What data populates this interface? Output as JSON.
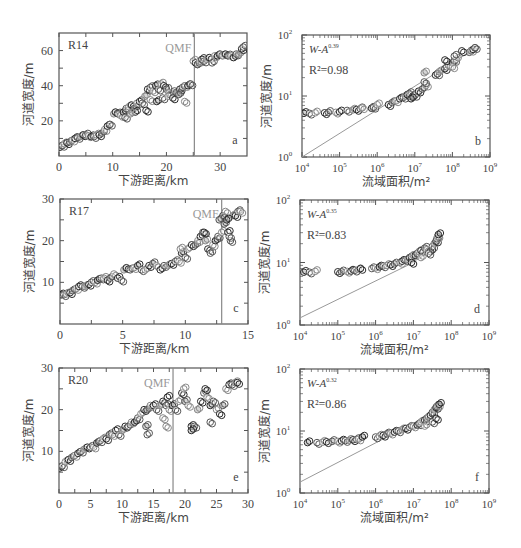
{
  "header_fragment": "",
  "chart_data": [
    {
      "id": "a",
      "type": "scatter",
      "panel_label": "a",
      "site": "R14",
      "xscale": "linear",
      "yscale": "linear",
      "xlabel": "下游距离/km",
      "ylabel": "河道宽度/m",
      "xlim": [
        0,
        35
      ],
      "ylim": [
        0,
        70
      ],
      "xticks": [
        0,
        10,
        20,
        30
      ],
      "yticks": [
        20,
        40,
        60
      ],
      "minor_x": [
        5,
        15,
        25
      ],
      "minor_y": [
        10,
        30,
        50
      ],
      "qmf": {
        "label": "QMF",
        "x": 25.2
      },
      "box": {
        "x": 59,
        "y": 33,
        "w": 188,
        "h": 123
      },
      "series": [
        {
          "name": "width",
          "x": [
            0.2,
            0.6,
            1,
            1.5,
            2,
            2.5,
            3,
            3.5,
            4,
            4.5,
            5,
            5.5,
            6,
            6.5,
            7,
            7.5,
            8,
            8.5,
            9,
            9.5,
            10.2,
            10.5,
            11,
            11.5,
            12,
            12.5,
            13,
            13.5,
            14,
            14.5,
            15,
            15.5,
            16,
            16.5,
            17,
            17.5,
            18,
            18.5,
            19,
            19.5,
            20,
            20.5,
            21,
            21.5,
            22,
            22.5,
            23,
            23.5,
            24,
            24.5,
            25,
            25.4,
            25.8,
            26.2,
            26.6,
            27,
            27.5,
            28,
            28.5,
            29,
            29.5,
            30,
            30.5,
            31,
            31.5,
            32,
            32.5,
            33,
            33.5,
            34,
            34.3,
            17,
            18.2,
            19.3,
            20.3,
            21.2,
            22.3,
            23.4,
            14.2,
            12.3,
            13.3,
            16.2
          ],
          "y": [
            5,
            6,
            7,
            7.5,
            8,
            9,
            10,
            10.5,
            11,
            12,
            12,
            11.5,
            11,
            11,
            12,
            12,
            13,
            15,
            17,
            18,
            24,
            25,
            24,
            23,
            25,
            27,
            28,
            29,
            27,
            30,
            31,
            30,
            34,
            38,
            39,
            37,
            40,
            38,
            41,
            40,
            38,
            36,
            35,
            37,
            36,
            38,
            39,
            40,
            40,
            41,
            54,
            53,
            52,
            54,
            55,
            54,
            55,
            56,
            53,
            57,
            57,
            58,
            57,
            58,
            57,
            57,
            56,
            58,
            58,
            61,
            62,
            32,
            31,
            33,
            34,
            33,
            35,
            31,
            25,
            22,
            24,
            26
          ]
        }
      ]
    },
    {
      "id": "b",
      "type": "scatter",
      "panel_label": "b",
      "xscale": "log",
      "yscale": "log",
      "xlabel": "流域面积/m²",
      "ylabel": "河道宽度/m",
      "xlim_exp": [
        4,
        9
      ],
      "ylim_exp": [
        0,
        2
      ],
      "xtick_exps": [
        4,
        5,
        6,
        7,
        8,
        9
      ],
      "ytick_exps": [
        0,
        1,
        2
      ],
      "equation": {
        "base": "W-A",
        "exponent": "0.39"
      },
      "r2": {
        "label": "R²=0.98",
        "value": 0.98
      },
      "fit_line": {
        "x_exp": [
          4,
          8.6
        ],
        "y": [
          1.0,
          60
        ]
      },
      "box": {
        "x": 302,
        "y": 35,
        "w": 188,
        "h": 122
      },
      "series": [
        {
          "name": "width",
          "logx": [
            4.05,
            4.2,
            4.35,
            4.6,
            4.7,
            4.9,
            5.0,
            5.2,
            5.35,
            5.45,
            5.55,
            5.6,
            5.85,
            5.9,
            6.0,
            6.3,
            6.4,
            6.5,
            6.6,
            6.7,
            6.75,
            6.8,
            6.85,
            6.9,
            6.95,
            7.0,
            7.05,
            7.1,
            7.2,
            7.3,
            7.55,
            7.6,
            7.65,
            7.8,
            7.85,
            7.9,
            8.0,
            8.05,
            8.1,
            8.25,
            8.45,
            8.5,
            8.55,
            8.6,
            7.25,
            7.8,
            8.05,
            8.0,
            6.9,
            7.25
          ],
          "y": [
            5.2,
            5.2,
            5.3,
            5.3,
            5.4,
            5.4,
            5.5,
            5.8,
            5.9,
            6.0,
            6.2,
            6.4,
            6.3,
            6.5,
            7.2,
            7.2,
            7.8,
            8.3,
            9.0,
            9.5,
            10,
            10.5,
            11,
            10.5,
            10,
            10.2,
            11,
            12,
            13,
            15,
            22,
            23,
            25,
            28,
            30,
            32,
            35,
            38,
            40,
            55,
            52,
            56,
            58,
            62,
            24,
            39,
            45,
            30,
            9,
            17
          ]
        }
      ]
    },
    {
      "id": "c",
      "type": "scatter",
      "panel_label": "c",
      "site": "R17",
      "xscale": "linear",
      "yscale": "linear",
      "xlabel": "下游距离/km",
      "ylabel": "河道宽度/m",
      "xlim": [
        0,
        15
      ],
      "ylim": [
        0,
        30
      ],
      "xticks": [
        0,
        5,
        10,
        15
      ],
      "yticks": [
        10,
        20,
        30
      ],
      "minor_x": [
        2.5,
        7.5,
        12.5
      ],
      "minor_y": [
        5,
        15,
        25
      ],
      "qmf": {
        "label": "QMF",
        "x": 12.9
      },
      "box": {
        "x": 60,
        "y": 199,
        "w": 188,
        "h": 125
      },
      "series": [
        {
          "name": "width",
          "x": [
            0.1,
            0.3,
            0.5,
            0.8,
            1,
            1.3,
            1.5,
            1.8,
            2,
            2.3,
            2.5,
            2.8,
            3,
            3.3,
            3.5,
            3.8,
            4,
            4.3,
            4.6,
            4.9,
            5.1,
            5.3,
            5.6,
            5.9,
            6.2,
            6.5,
            6.8,
            7.1,
            7.4,
            7.7,
            8,
            8.3,
            8.6,
            8.9,
            9.2,
            9.5,
            9.7,
            10,
            10.2,
            10.5,
            10.8,
            11,
            11.2,
            11.4,
            11.6,
            11.8,
            12,
            12.2,
            12.4,
            12.6,
            12.9,
            13,
            13.1,
            13.2,
            13.4,
            13.6,
            13.8,
            14,
            14.2,
            14.4,
            13.3,
            13.5,
            9.6,
            11.5,
            12.7
          ],
          "y": [
            7,
            7,
            7.2,
            7.5,
            8,
            8.5,
            9,
            9,
            9,
            9.5,
            10,
            10,
            10.5,
            11,
            11,
            10.5,
            11,
            12,
            11,
            10.5,
            13,
            13.5,
            13,
            13.5,
            14,
            13,
            13,
            14,
            14.5,
            14,
            13,
            14,
            14,
            14.5,
            15,
            15,
            17,
            16,
            18,
            19,
            19,
            20,
            21,
            22,
            20,
            18,
            17,
            19,
            20,
            21,
            22,
            26,
            24,
            27,
            22,
            20,
            26,
            26,
            27,
            27,
            25,
            21,
            18,
            22,
            25
          ]
        }
      ]
    },
    {
      "id": "d",
      "type": "scatter",
      "panel_label": "d",
      "xscale": "log",
      "yscale": "log",
      "xlabel": "流域面积/m²",
      "ylabel": "河道宽度/m",
      "xlim_exp": [
        4,
        9
      ],
      "ylim_exp": [
        0,
        2
      ],
      "xtick_exps": [
        4,
        5,
        6,
        7,
        8,
        9
      ],
      "ytick_exps": [
        0,
        1,
        2
      ],
      "equation": {
        "base": "W-A",
        "exponent": "0.35"
      },
      "r2": {
        "label": "R²=0.83",
        "value": 0.83
      },
      "fit_line": {
        "x_exp": [
          4,
          7.0
        ],
        "y": [
          1.3,
          10
        ]
      },
      "box": {
        "x": 300,
        "y": 200,
        "w": 189,
        "h": 125
      },
      "series": [
        {
          "name": "width",
          "logx": [
            4.1,
            4.25,
            4.4,
            5.0,
            5.1,
            5.25,
            5.35,
            5.45,
            5.55,
            5.6,
            5.9,
            6.0,
            6.1,
            6.2,
            6.3,
            6.4,
            6.5,
            6.65,
            6.7,
            6.8,
            6.85,
            6.9,
            6.95,
            7.0,
            7.05,
            7.1,
            7.15,
            7.2,
            7.3,
            7.35,
            7.45,
            7.5,
            7.55,
            7.6,
            7.62,
            7.64,
            7.66,
            7.4,
            7.2,
            6.95
          ],
          "y": [
            7,
            7,
            7.2,
            7.1,
            7.1,
            7.2,
            7.3,
            7.5,
            7.7,
            8,
            8,
            8.2,
            8.5,
            8.8,
            9,
            9.2,
            9.5,
            10,
            10.5,
            11,
            11,
            12,
            12.5,
            13,
            13,
            14,
            15,
            15.5,
            17,
            16,
            15,
            18,
            20,
            22,
            24,
            26,
            28,
            14,
            12,
            10
          ]
        }
      ]
    },
    {
      "id": "e",
      "type": "scatter",
      "panel_label": "e",
      "site": "R20",
      "xscale": "linear",
      "yscale": "linear",
      "xlabel": "下游距离/km",
      "ylabel": "河道宽度/m",
      "xlim": [
        0,
        30
      ],
      "ylim": [
        0,
        30
      ],
      "xticks": [
        0,
        5,
        10,
        15,
        20,
        25,
        30
      ],
      "yticks": [
        10,
        20,
        30
      ],
      "minor_x": [
        2.5,
        7.5,
        12.5,
        17.5,
        22.5,
        27.5
      ],
      "minor_y": [
        5,
        15,
        25
      ],
      "qmf": {
        "label": "QMF",
        "x": 18.1
      },
      "box": {
        "x": 59,
        "y": 368,
        "w": 189,
        "h": 125
      },
      "series": [
        {
          "name": "width",
          "x": [
            0.1,
            0.5,
            1,
            1.5,
            2,
            2.5,
            3,
            3.5,
            4,
            4.5,
            5,
            5.5,
            6,
            6.5,
            7,
            7.5,
            8,
            8.5,
            9,
            9.5,
            10,
            10.5,
            11,
            11.5,
            12,
            12.5,
            13,
            13.5,
            14,
            14.5,
            15,
            15.5,
            16,
            16.5,
            17,
            17.5,
            18,
            18.5,
            19,
            19.5,
            20,
            20.5,
            21,
            21.5,
            22,
            22.5,
            23,
            23.5,
            24,
            24.5,
            25,
            25.5,
            26,
            26.5,
            27,
            27.5,
            28,
            28.3,
            14,
            17,
            21,
            24,
            19.8,
            23.2,
            13.8,
            16.5,
            17.2
          ],
          "y": [
            6,
            6.5,
            7.5,
            8,
            8.5,
            9,
            9.5,
            10,
            10.5,
            11,
            11,
            11,
            12,
            12.5,
            13,
            13,
            14,
            14,
            15,
            14,
            15,
            16,
            16,
            17,
            17,
            18,
            19,
            20,
            20,
            21,
            21,
            20,
            21,
            22,
            21,
            20,
            21,
            20,
            22,
            24,
            22,
            21,
            16,
            16,
            20,
            22,
            24,
            23,
            21,
            22,
            20,
            19,
            21,
            25,
            26,
            26,
            26.5,
            26.5,
            14,
            16,
            15,
            17,
            25,
            25,
            16,
            18,
            23
          ]
        }
      ]
    },
    {
      "id": "f",
      "type": "scatter",
      "panel_label": "f",
      "xscale": "log",
      "yscale": "log",
      "xlabel": "流域面积/m²",
      "ylabel": "河道宽度/m",
      "xlim_exp": [
        4,
        9
      ],
      "ylim_exp": [
        0,
        2
      ],
      "xtick_exps": [
        4,
        5,
        6,
        7,
        8,
        9
      ],
      "ytick_exps": [
        0,
        1,
        2
      ],
      "equation": {
        "base": "W-A",
        "exponent": "0.32"
      },
      "r2": {
        "label": "R²=0.86",
        "value": 0.86
      },
      "fit_line": {
        "x_exp": [
          4,
          6.3
        ],
        "y": [
          1.5,
          8
        ]
      },
      "box": {
        "x": 300,
        "y": 369,
        "w": 189,
        "h": 124
      },
      "series": [
        {
          "name": "width",
          "logx": [
            4.2,
            4.45,
            4.6,
            4.7,
            4.85,
            5.0,
            5.1,
            5.2,
            5.3,
            5.4,
            5.5,
            5.55,
            5.65,
            6.0,
            6.1,
            6.2,
            6.3,
            6.4,
            6.5,
            6.6,
            6.7,
            6.8,
            6.9,
            7.0,
            7.1,
            7.15,
            7.2,
            7.3,
            7.35,
            7.4,
            7.45,
            7.5,
            7.55,
            7.6,
            7.62,
            7.65,
            7.68,
            7.5,
            7.3,
            7.6
          ],
          "y": [
            6.5,
            6.5,
            6.6,
            6.7,
            6.8,
            6.8,
            6.9,
            7,
            7.1,
            7.2,
            7.3,
            7.4,
            8,
            8,
            8.3,
            8.5,
            9,
            9.2,
            9.6,
            10,
            10.5,
            11,
            11.5,
            12,
            12.5,
            13,
            14,
            15,
            16,
            17,
            18,
            20,
            22,
            24,
            25,
            26,
            27,
            14,
            12,
            16
          ]
        }
      ]
    }
  ]
}
